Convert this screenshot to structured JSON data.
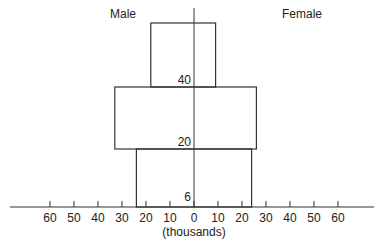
{
  "chart_data": {
    "type": "bar",
    "subtype": "population-pyramid",
    "title": "",
    "xlabel": "(thousands)",
    "ylabel": "",
    "legend": {
      "left": "Male",
      "right": "Female"
    },
    "x_ticks": [
      "60",
      "50",
      "40",
      "30",
      "20",
      "10",
      "0",
      "10",
      "20",
      "30",
      "40",
      "50",
      "60"
    ],
    "xlim": [
      -65,
      75
    ],
    "age_labels": [
      "6",
      "20",
      "40"
    ],
    "categories": [
      "6-20",
      "20-40",
      "40+"
    ],
    "series": [
      {
        "name": "Male",
        "values": [
          24,
          33,
          18
        ]
      },
      {
        "name": "Female",
        "values": [
          24,
          26,
          9
        ]
      }
    ],
    "grid": false
  }
}
